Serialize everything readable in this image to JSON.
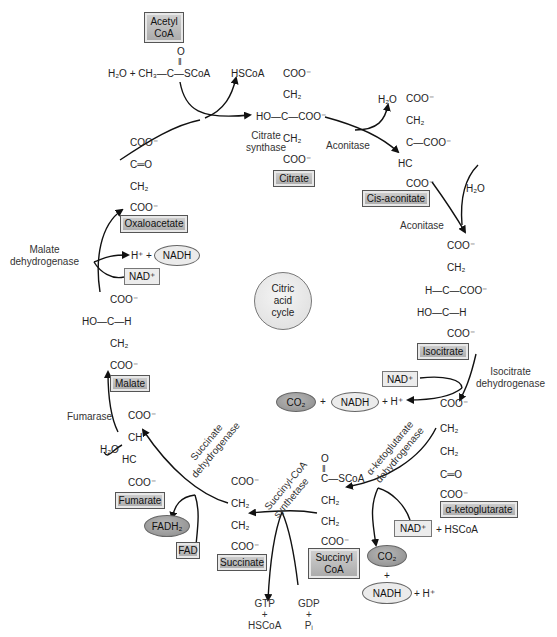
{
  "diagram": {
    "title": "Citric acid cycle",
    "center_label": [
      "Citric",
      "acid",
      "cycle"
    ],
    "metabolites": [
      {
        "id": "acetyl-coa",
        "label": [
          "Acetyl",
          "CoA"
        ]
      },
      {
        "id": "citrate",
        "label": "Citrate"
      },
      {
        "id": "cis-aconitate",
        "label": "Cis-aconitate"
      },
      {
        "id": "isocitrate",
        "label": "Isocitrate"
      },
      {
        "id": "alpha-ketoglutarate",
        "label": "α-ketoglutarate"
      },
      {
        "id": "succinyl-coa",
        "label": [
          "Succinyl",
          "CoA"
        ]
      },
      {
        "id": "succinate",
        "label": "Succinate"
      },
      {
        "id": "fumarate",
        "label": "Fumarate"
      },
      {
        "id": "malate",
        "label": "Malate"
      },
      {
        "id": "oxaloacetate",
        "label": "Oxaloacetate"
      }
    ],
    "enzymes": [
      {
        "id": "citrate-synthase",
        "label": [
          "Citrate",
          "synthase"
        ]
      },
      {
        "id": "aconitase-1",
        "label": "Aconitase"
      },
      {
        "id": "aconitase-2",
        "label": "Aconitase"
      },
      {
        "id": "isocitrate-dehydrogenase",
        "label": [
          "Isocitrate",
          "dehydrogenase"
        ]
      },
      {
        "id": "akg-dehydrogenase",
        "label": [
          "α-ketoglutarate",
          "dehydrogenase"
        ]
      },
      {
        "id": "succinyl-coa-synthetase",
        "label": [
          "Succinyl-CoA",
          "synthetase"
        ]
      },
      {
        "id": "succinate-dehydrogenase",
        "label": [
          "Succinate",
          "dehydrogenase"
        ]
      },
      {
        "id": "fumarase",
        "label": "Fumarase"
      },
      {
        "id": "malate-dehydrogenase",
        "label": [
          "Malate",
          "dehydrogenase"
        ]
      }
    ],
    "cofactors": {
      "nad_plus": "NAD⁺",
      "nadh": "NADH",
      "co2": "CO₂",
      "fad": "FAD",
      "fadh2": "FADH₂",
      "h_plus": "+ H⁺",
      "hscoa": "HSCoA",
      "plus_hscoa": "+ HSCoA",
      "gtp": "GTP",
      "gdp": "GDP",
      "pi": "Pᵢ",
      "plus": "+",
      "h2o": "H₂O"
    },
    "structures": {
      "acetyl_reactants": "H₂O + CH₃—C—SCoA",
      "acetyl_carbonyl": "O",
      "citrate": [
        "COO⁻",
        "CH₂",
        "HO—C—COO⁻",
        "CH₂",
        "COO⁻"
      ],
      "cis_aconitate": [
        "COO⁻",
        "CH₂",
        "C—COO⁻",
        "HC",
        "COO⁻"
      ],
      "isocitrate": [
        "COO⁻",
        "CH₂",
        "H—C—COO⁻",
        "HO—C—H",
        "COO⁻"
      ],
      "alpha_ketoglutarate": [
        "COO⁻",
        "CH₂",
        "CH₂",
        "C═O",
        "COO⁻"
      ],
      "succinyl_coa": [
        "O",
        "C—SCoA",
        "CH₂",
        "CH₂",
        "COO⁻"
      ],
      "succinate": [
        "COO⁻",
        "CH₂",
        "CH₂",
        "COO⁻"
      ],
      "fumarate": [
        "COO⁻",
        "CH",
        "HC",
        "COO⁻"
      ],
      "malate": [
        "COO⁻",
        "HO—C—H",
        "CH₂",
        "COO⁻"
      ],
      "oxaloacetate": [
        "COO⁻",
        "C═O",
        "CH₂",
        "COO⁻"
      ]
    },
    "colors": {
      "box_fill": "#b8b8b8",
      "light_box_fill": "#ececec",
      "dark_ellipse": "#9a9a9a",
      "light_ellipse": "#ebebeb",
      "line": "#111111"
    }
  }
}
